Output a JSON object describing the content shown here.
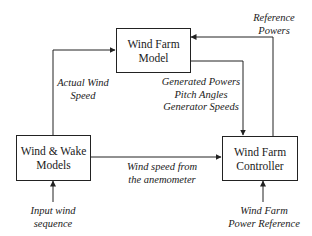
{
  "diagram": {
    "blocks": {
      "model": {
        "line1": "Wind Farm",
        "line2": "Model"
      },
      "wake": {
        "line1": "Wind & Wake",
        "line2": "Models"
      },
      "controller": {
        "line1": "Wind Farm",
        "line2": "Controller"
      }
    },
    "signals": {
      "actual_wind": {
        "line1": "Actual Wind",
        "line2": "Speed"
      },
      "reference_powers": {
        "line1": "Reference",
        "line2": "Powers"
      },
      "measurements": {
        "line1": "Generated Powers",
        "line2": "Pitch Angles",
        "line3": "Generator Speeds"
      },
      "anemometer": {
        "line1": "Wind speed from",
        "line2": "the anemometer"
      },
      "input_wind": {
        "line1": "Input wind",
        "line2": "sequence"
      },
      "power_reference": {
        "line1": "Wind Farm",
        "line2": "Power Reference"
      }
    },
    "colors": {
      "line": "#222222",
      "background": "#ffffff"
    }
  }
}
